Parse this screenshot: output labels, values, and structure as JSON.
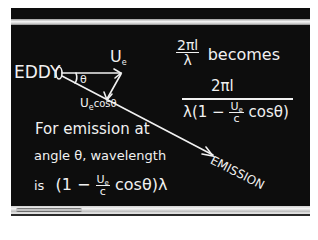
{
  "board": {
    "background": "#0d0d0d",
    "chalk_color": "#f1f1f1"
  },
  "diagram": {
    "eddy_label": "EDDY",
    "velocity_label": "U",
    "velocity_sub": "e",
    "angle_label": "θ",
    "component_label": "U",
    "component_sub": "e",
    "component_suffix": "cosθ",
    "emission_label": "EMISSION"
  },
  "equation_top": {
    "numerator": "2πl",
    "denominator": "λ",
    "word": "becomes"
  },
  "equation_big": {
    "numerator": "2πl",
    "denominator_prefix": "λ(1 −",
    "frac_num": "U",
    "frac_num_sub": "e",
    "frac_den": "c",
    "denominator_suffix": "cosθ)"
  },
  "statement": {
    "line1": "For emission at",
    "line2": "angle θ, wavelength",
    "line3_prefix": "is",
    "line3_open": "(1 −",
    "frac_num": "U",
    "frac_num_sub": "e",
    "frac_den": "c",
    "line3_suffix": "cosθ)λ"
  }
}
